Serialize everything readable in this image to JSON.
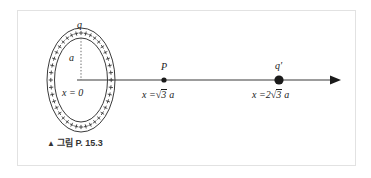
{
  "figure": {
    "caption_marker": "▲",
    "caption_text": "그림 P. 15.3",
    "ring": {
      "charge_label": "q",
      "radius_label": "a",
      "position_label": "x = 0",
      "charge_sign": "+",
      "plus_count": 40
    },
    "axis": {
      "arrow_direction": "right"
    },
    "points": [
      {
        "name": "P",
        "label": "P",
        "position_prefix": "x =",
        "position_coefficient": "",
        "radical": "√",
        "radicand": "3",
        "position_suffix": "a",
        "position_full": "x = √3 a",
        "dot_size": 3
      },
      {
        "name": "q-prime",
        "label": "q′",
        "position_prefix": "x =",
        "position_coefficient": "2",
        "radical": "√",
        "radicand": "3",
        "position_suffix": "a",
        "position_full": "x = 2√3 a",
        "dot_size": 7
      }
    ],
    "colors": {
      "ink": "#1a1a1a",
      "frame": "#e2e2e2",
      "background": "#ffffff"
    }
  }
}
